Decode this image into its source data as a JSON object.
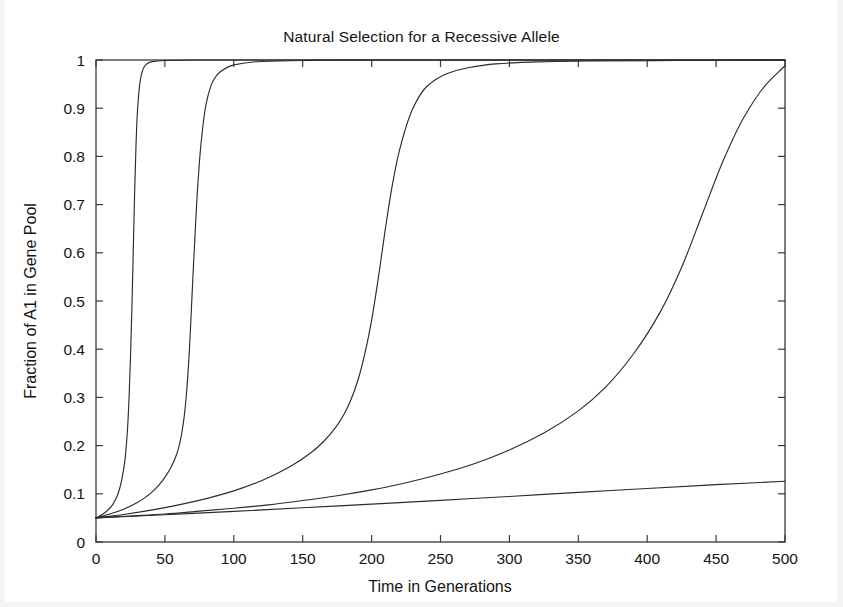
{
  "chart_data": {
    "type": "line",
    "title": "Natural Selection for a Recessive Allele",
    "xlabel": "Time in Generations",
    "ylabel": "Fraction of A1 in Gene Pool",
    "xlim": [
      0,
      500
    ],
    "ylim": [
      0,
      1
    ],
    "xticks": [
      0,
      50,
      100,
      150,
      200,
      250,
      300,
      350,
      400,
      450,
      500
    ],
    "xtick_labels": [
      "0",
      "50",
      "100",
      "150",
      "200",
      "250",
      "300",
      "350",
      "400",
      "450",
      "500"
    ],
    "yticks": [
      0,
      0.1,
      0.2,
      0.3,
      0.4,
      0.5,
      0.6,
      0.7,
      0.8,
      0.9,
      1
    ],
    "ytick_labels": [
      "0",
      "0.1",
      "0.2",
      "0.3",
      "0.4",
      "0.5",
      "0.6",
      "0.7",
      "0.8",
      "0.9",
      "1"
    ],
    "grid": false,
    "legend": "none",
    "initial_fraction": 0.05,
    "line_color": "#2b2b2b",
    "background_color": "#ffffff",
    "series": [
      {
        "name": "curve-1",
        "selection_coefficient": 1.0,
        "x": [
          0,
          5,
          10,
          12,
          14,
          16,
          18,
          20,
          21,
          22,
          23,
          24,
          25,
          26,
          27,
          28,
          29,
          30,
          32,
          34,
          36,
          40,
          50,
          70,
          100,
          150,
          200,
          300,
          400,
          500
        ],
        "y": [
          0.05,
          0.058,
          0.07,
          0.077,
          0.087,
          0.1,
          0.12,
          0.15,
          0.17,
          0.2,
          0.24,
          0.3,
          0.38,
          0.48,
          0.6,
          0.72,
          0.82,
          0.89,
          0.955,
          0.98,
          0.99,
          0.996,
          0.999,
          1.0,
          1.0,
          1.0,
          1.0,
          1.0,
          1.0,
          1.0
        ]
      },
      {
        "name": "curve-2",
        "selection_coefficient": 0.4,
        "x": [
          0,
          10,
          20,
          30,
          35,
          40,
          45,
          50,
          55,
          58,
          60,
          62,
          64,
          66,
          68,
          70,
          73,
          76,
          80,
          85,
          90,
          100,
          120,
          150,
          200,
          300,
          400,
          500
        ],
        "y": [
          0.05,
          0.058,
          0.068,
          0.082,
          0.091,
          0.102,
          0.116,
          0.134,
          0.158,
          0.178,
          0.196,
          0.222,
          0.26,
          0.32,
          0.41,
          0.53,
          0.7,
          0.82,
          0.91,
          0.957,
          0.975,
          0.99,
          0.997,
          0.999,
          1.0,
          1.0,
          1.0,
          1.0
        ]
      },
      {
        "name": "curve-3",
        "selection_coefficient": 0.14,
        "x": [
          0,
          20,
          40,
          60,
          80,
          100,
          120,
          140,
          155,
          165,
          175,
          180,
          185,
          190,
          195,
          200,
          205,
          210,
          215,
          220,
          230,
          240,
          255,
          270,
          290,
          320,
          360,
          420,
          500
        ],
        "y": [
          0.05,
          0.057,
          0.066,
          0.077,
          0.09,
          0.106,
          0.127,
          0.155,
          0.183,
          0.208,
          0.242,
          0.265,
          0.295,
          0.335,
          0.39,
          0.46,
          0.55,
          0.65,
          0.74,
          0.81,
          0.9,
          0.945,
          0.972,
          0.984,
          0.992,
          0.996,
          0.998,
          0.999,
          1.0
        ]
      },
      {
        "name": "curve-4",
        "selection_coefficient": 0.055,
        "x": [
          0,
          25,
          50,
          75,
          100,
          125,
          150,
          175,
          200,
          225,
          250,
          275,
          300,
          325,
          350,
          370,
          390,
          410,
          425,
          440,
          455,
          470,
          485,
          500
        ],
        "y": [
          0.05,
          0.054,
          0.058,
          0.064,
          0.07,
          0.077,
          0.086,
          0.096,
          0.108,
          0.123,
          0.141,
          0.163,
          0.191,
          0.226,
          0.272,
          0.322,
          0.39,
          0.48,
          0.57,
          0.68,
          0.79,
          0.88,
          0.945,
          0.988
        ]
      },
      {
        "name": "curve-5",
        "selection_coefficient": 0.0045,
        "x": [
          0,
          50,
          100,
          150,
          200,
          250,
          300,
          350,
          400,
          450,
          500
        ],
        "y": [
          0.05,
          0.0565,
          0.0635,
          0.071,
          0.0785,
          0.0865,
          0.0945,
          0.103,
          0.111,
          0.119,
          0.126
        ]
      }
    ]
  },
  "axes": {
    "title_text": "Natural Selection for a Recessive Allele",
    "x_axis_title": "Time in Generations",
    "y_axis_title": "Fraction of A1 in Gene Pool"
  }
}
